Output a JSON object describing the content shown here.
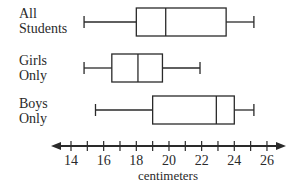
{
  "chart_data": {
    "type": "boxplot",
    "title": "",
    "xlabel": "centimeters",
    "ylabel": "",
    "xlim": [
      13,
      27
    ],
    "x_ticks": [
      14,
      15,
      16,
      17,
      18,
      19,
      20,
      21,
      22,
      23,
      24,
      25,
      26
    ],
    "x_tick_labels": [
      "14",
      "16",
      "18",
      "20",
      "22",
      "24",
      "26"
    ],
    "grid": false,
    "legend": null,
    "series": [
      {
        "name": "All Students",
        "label_lines": [
          "All",
          "Students"
        ],
        "min": 14.8,
        "q1": 18,
        "median": 19.8,
        "q3": 23.5,
        "max": 25.2
      },
      {
        "name": "Girls Only",
        "label_lines": [
          "Girls",
          "Only"
        ],
        "min": 14.8,
        "q1": 16.5,
        "median": 18.1,
        "q3": 19.6,
        "max": 21.9
      },
      {
        "name": "Boys Only",
        "label_lines": [
          "Boys",
          "Only"
        ],
        "min": 15.5,
        "q1": 19,
        "median": 22.9,
        "q3": 24,
        "max": 25.2
      }
    ]
  },
  "colors": {
    "stroke": "#2a2a2a",
    "background": "#ffffff"
  }
}
